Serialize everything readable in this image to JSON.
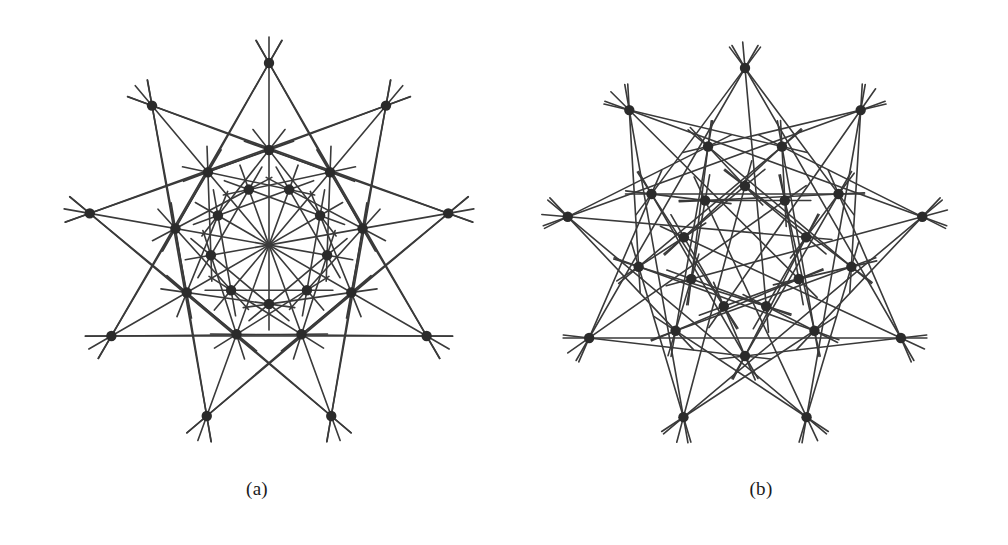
{
  "figure": {
    "background_color": "#ffffff",
    "line_color": "#3a3a3a",
    "vertex_color": "#2b2b2b",
    "caption_color": "#1a1a1a",
    "panels": [
      {
        "id": "a",
        "caption": "(a)",
        "center": [
          269,
          245
        ],
        "symmetry_order": 9,
        "vertex_count": 27,
        "vertex_radius_px": 5.2,
        "line_width_px": 1.6,
        "line_overshoot_px": 26,
        "rings": [
          {
            "name": "outer",
            "radius": 182,
            "phase_deg": -90,
            "count": 9
          },
          {
            "name": "middle",
            "radius": 95,
            "phase_deg": -90,
            "count": 9
          },
          {
            "name": "inner",
            "radius": 59,
            "phase_deg": -70,
            "count": 9
          }
        ],
        "chords": [
          {
            "from_ring": 0,
            "to_ring": 0,
            "step": 3
          },
          {
            "from_ring": 0,
            "to_ring": 1,
            "step": 2
          },
          {
            "from_ring": 0,
            "to_ring": 1,
            "step": -2
          },
          {
            "from_ring": 1,
            "to_ring": 2,
            "step": 1
          },
          {
            "from_ring": 1,
            "to_ring": 2,
            "step": -2
          },
          {
            "from_ring": 2,
            "to_ring": 2,
            "step": 2
          },
          {
            "from_ring": 0,
            "to_ring": 2,
            "step": 4
          }
        ]
      },
      {
        "id": "b",
        "caption": "(b)",
        "center": [
          745,
          248
        ],
        "symmetry_order": 9,
        "vertex_count": 27,
        "vertex_radius_px": 5.2,
        "line_width_px": 1.6,
        "line_overshoot_px": 26,
        "rings": [
          {
            "name": "outer",
            "radius": 180,
            "phase_deg": -90,
            "count": 9
          },
          {
            "name": "middle",
            "radius": 108,
            "phase_deg": -70,
            "count": 9
          },
          {
            "name": "inner",
            "radius": 62,
            "phase_deg": -90,
            "count": 9
          }
        ],
        "chords": [
          {
            "from_ring": 0,
            "to_ring": 0,
            "step": 3
          },
          {
            "from_ring": 0,
            "to_ring": 1,
            "step": 1
          },
          {
            "from_ring": 0,
            "to_ring": 1,
            "step": -2
          },
          {
            "from_ring": 1,
            "to_ring": 1,
            "step": 3
          },
          {
            "from_ring": 1,
            "to_ring": 2,
            "step": 1
          },
          {
            "from_ring": 1,
            "to_ring": 2,
            "step": -2
          },
          {
            "from_ring": 2,
            "to_ring": 2,
            "step": 2
          },
          {
            "from_ring": 0,
            "to_ring": 2,
            "step": 4
          }
        ]
      }
    ]
  }
}
